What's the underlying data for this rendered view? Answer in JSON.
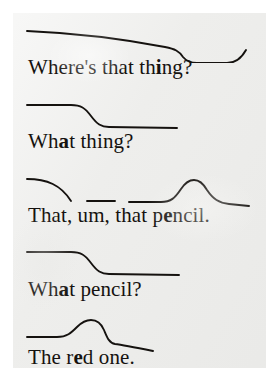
{
  "figure": {
    "type": "intonation-contour-dialogue",
    "background_color": "#eeeeec",
    "ink_color": "#15120f",
    "utterances": [
      {
        "id": "u0",
        "text_before": "Where's that th",
        "stressed": "i",
        "text_after": "ng?",
        "full_text": "Where's that thing?",
        "contour_description": "gradual fall, sharp drop, low plateau, final rise",
        "path": "M 14 14 C 60 16 110 22 152 30 C 162 32 166 34 170 40 C 174 45 178 46 184 46 L 214 46 C 222 46 228 42 233 33"
      },
      {
        "id": "u1",
        "text_before": "Wh",
        "stressed": "a",
        "text_after": "t thing?",
        "full_text": "What thing?",
        "contour_description": "high level, fall, low level",
        "path": "M 14 14 L 58 14 C 68 14 72 17 78 25 C 84 33 88 36 96 36 L 164 37"
      },
      {
        "id": "u2",
        "text_before": "That, um, that p",
        "stressed": "e",
        "text_after": "ncil.",
        "full_text": "That, um, that pencil.",
        "contour_description": "falling curve; short level; level with rise-fall peak then tail",
        "path_segments": [
          "M 14 14 C 34 14 48 20 58 36",
          "M 74 36 L 102 36",
          "M 116 37 L 148 37 C 158 37 162 33 168 24 C 172 18 176 15 181 15 C 186 15 190 18 194 25 C 200 34 206 38 216 39 L 236 41"
        ]
      },
      {
        "id": "u3",
        "text_before": "Wh",
        "stressed": "a",
        "text_after": "t pencil?",
        "full_text": "What pencil?",
        "contour_description": "high level, fall, low level",
        "path": "M 14 13 L 58 13 C 68 13 72 16 78 24 C 84 32 88 35 96 35 L 166 36"
      },
      {
        "id": "u4",
        "text_before": "The r",
        "stressed": "e",
        "text_after": "d one.",
        "full_text": "The red one.",
        "contour_description": "low level, rise to peak, sharp fall, gradual decline",
        "path": "M 14 30 L 44 30 C 54 30 58 26 64 20 C 69 15 73 13 78 13 C 84 13 88 16 91 23 C 94 30 96 36 102 37 C 110 38 120 40 140 44"
      }
    ]
  }
}
